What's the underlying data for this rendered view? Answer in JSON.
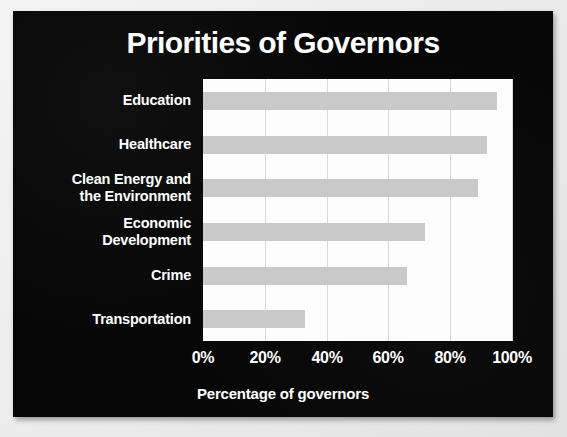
{
  "panel": {
    "background_color": "#070707",
    "text_color": "#ffffff",
    "bar_color": "#c9c9c9",
    "plot_background_color": "#fdfdfd",
    "gridline_color": "#d9d9d9"
  },
  "chart_data": {
    "type": "bar",
    "orientation": "horizontal",
    "title": "Priorities of Governors",
    "xlabel": "Percentage of governors",
    "ylabel": "",
    "categories": [
      "Education",
      "Healthcare",
      "Clean Energy and the Environment",
      "Economic Development",
      "Crime",
      "Transportation"
    ],
    "category_lines": [
      [
        "Education"
      ],
      [
        "Healthcare"
      ],
      [
        "Clean Energy and",
        "the Environment"
      ],
      [
        "Economic",
        "Development"
      ],
      [
        "Crime"
      ],
      [
        "Transportation"
      ]
    ],
    "values": [
      95,
      92,
      89,
      72,
      66,
      33
    ],
    "value_unit": "%",
    "xlim": [
      0,
      100
    ],
    "xticks": [
      0,
      20,
      40,
      60,
      80,
      100
    ],
    "xtick_labels": [
      "0%",
      "20%",
      "40%",
      "60%",
      "80%",
      "100%"
    ],
    "grid": true,
    "grid_axis": "x",
    "legend": false,
    "legend_position": "none",
    "series": [
      {
        "name": "Percentage of governors",
        "values": [
          95,
          92,
          89,
          72,
          66,
          33
        ]
      }
    ]
  }
}
